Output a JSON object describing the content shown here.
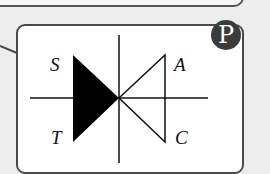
{
  "badge": {
    "label": "P",
    "color": "#3b3b3b"
  },
  "diagram": {
    "labels": {
      "top_left": "S",
      "top_right": "A",
      "bottom_left": "T",
      "bottom_right": "C"
    },
    "stroke_color": "#111111",
    "fill_color": "#000000"
  }
}
